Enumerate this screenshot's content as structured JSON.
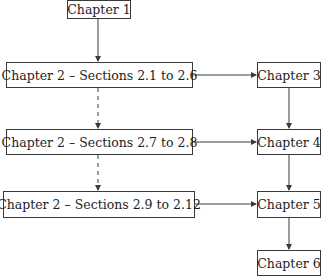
{
  "diagram": {
    "type": "flowchart",
    "nodes": [
      {
        "id": "ch1",
        "label": "Chapter 1"
      },
      {
        "id": "ch2a",
        "label": "Chapter 2 – Sections 2.1 to 2.6"
      },
      {
        "id": "ch3",
        "label": "Chapter 3"
      },
      {
        "id": "ch2b",
        "label": "Chapter 2 – Sections 2.7 to 2.8"
      },
      {
        "id": "ch4",
        "label": "Chapter 4"
      },
      {
        "id": "ch2c",
        "label": "Chapter 2 – Sections 2.9 to 2.12"
      },
      {
        "id": "ch5",
        "label": "Chapter 5"
      },
      {
        "id": "ch6",
        "label": "Chapter 6"
      }
    ],
    "edges": [
      {
        "from": "ch1",
        "to": "ch2a",
        "style": "solid"
      },
      {
        "from": "ch2a",
        "to": "ch3",
        "style": "solid"
      },
      {
        "from": "ch2a",
        "to": "ch2b",
        "style": "dashed"
      },
      {
        "from": "ch3",
        "to": "ch4",
        "style": "solid"
      },
      {
        "from": "ch2b",
        "to": "ch4",
        "style": "solid"
      },
      {
        "from": "ch2b",
        "to": "ch2c",
        "style": "dashed"
      },
      {
        "from": "ch4",
        "to": "ch5",
        "style": "solid"
      },
      {
        "from": "ch2c",
        "to": "ch5",
        "style": "solid"
      },
      {
        "from": "ch5",
        "to": "ch6",
        "style": "solid"
      }
    ],
    "colors": {
      "line": "#3a3a3a",
      "text": "#1e1e1e",
      "background": "#ffffff"
    }
  }
}
